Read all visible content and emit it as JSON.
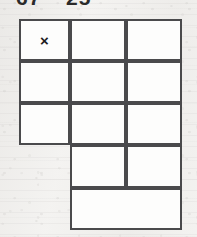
{
  "page": {
    "background_color": "#f3f2f0",
    "line_color": "#4a4a4c",
    "cell_fill": "#fdfdfc",
    "ink_color": "#1c1c1c"
  },
  "top_labels": {
    "note": "partially cropped numerals at the top edge of the scan",
    "left": "67",
    "right": "25"
  },
  "grid": {
    "description": "five-row figure: a 3x3 block on top, then two rows occupying only the right two columns, the last of which is one merged cell",
    "columns": 3,
    "rows": 5,
    "x_lines": [
      19,
      70,
      126,
      182
    ],
    "y_lines": [
      19,
      61,
      103,
      145,
      188,
      230
    ],
    "cells": [
      {
        "name": "cell-r1c1",
        "row": 1,
        "col": 1,
        "x": 19,
        "y": 19,
        "w": 51,
        "h": 42,
        "mark": "×"
      },
      {
        "name": "cell-r1c2",
        "row": 1,
        "col": 2,
        "x": 70,
        "y": 19,
        "w": 56,
        "h": 42,
        "mark": ""
      },
      {
        "name": "cell-r1c3",
        "row": 1,
        "col": 3,
        "x": 126,
        "y": 19,
        "w": 56,
        "h": 42,
        "mark": ""
      },
      {
        "name": "cell-r2c1",
        "row": 2,
        "col": 1,
        "x": 19,
        "y": 61,
        "w": 51,
        "h": 42,
        "mark": ""
      },
      {
        "name": "cell-r2c2",
        "row": 2,
        "col": 2,
        "x": 70,
        "y": 61,
        "w": 56,
        "h": 42,
        "mark": ""
      },
      {
        "name": "cell-r2c3",
        "row": 2,
        "col": 3,
        "x": 126,
        "y": 61,
        "w": 56,
        "h": 42,
        "mark": ""
      },
      {
        "name": "cell-r3c1",
        "row": 3,
        "col": 1,
        "x": 19,
        "y": 103,
        "w": 51,
        "h": 42,
        "mark": ""
      },
      {
        "name": "cell-r3c2",
        "row": 3,
        "col": 2,
        "x": 70,
        "y": 103,
        "w": 56,
        "h": 42,
        "mark": ""
      },
      {
        "name": "cell-r3c3",
        "row": 3,
        "col": 3,
        "x": 126,
        "y": 103,
        "w": 56,
        "h": 42,
        "mark": ""
      },
      {
        "name": "cell-r4c2",
        "row": 4,
        "col": 2,
        "x": 70,
        "y": 145,
        "w": 56,
        "h": 43,
        "mark": ""
      },
      {
        "name": "cell-r4c3",
        "row": 4,
        "col": 3,
        "x": 126,
        "y": 145,
        "w": 56,
        "h": 43,
        "mark": ""
      },
      {
        "name": "cell-r5-merged",
        "row": 5,
        "col": 2,
        "colspan": 2,
        "x": 70,
        "y": 188,
        "w": 112,
        "h": 42,
        "mark": ""
      }
    ]
  }
}
